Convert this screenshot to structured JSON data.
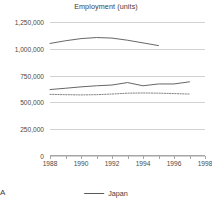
{
  "chart_data": {
    "type": "line",
    "title": "Employment (units)",
    "xlabel": "",
    "ylabel": "",
    "xlim": [
      1988,
      1998
    ],
    "ylim": [
      0,
      1250000
    ],
    "ytick_labels": [
      "0",
      "250,000",
      "500,000",
      "750,000",
      "1,000,000",
      "1,250,000"
    ],
    "ytick_values": [
      0,
      250000,
      500000,
      750000,
      1000000,
      1250000
    ],
    "xtick_labels": [
      "1988",
      "1990",
      "1992",
      "1994",
      "1996",
      "1998"
    ],
    "xtick_values": [
      1988,
      1990,
      1992,
      1994,
      1996,
      1998
    ],
    "minor_xticks": [
      1988,
      1989,
      1990,
      1991,
      1992,
      1993,
      1994,
      1995,
      1996,
      1997,
      1998
    ],
    "grid": "horizontal",
    "legend_position": "bottom",
    "series": [
      {
        "name": "series-upper",
        "style": "solid",
        "color": "#555555",
        "x": [
          1988,
          1989,
          1990,
          1991,
          1992,
          1993,
          1994,
          1995
        ],
        "values": [
          1050000,
          1075000,
          1095000,
          1105000,
          1100000,
          1080000,
          1055000,
          1030000
        ]
      },
      {
        "name": "Japan",
        "style": "solid",
        "color": "#555555",
        "x": [
          1988,
          1989,
          1990,
          1991,
          1992,
          1993,
          1994,
          1995,
          1996,
          1997
        ],
        "values": [
          620000,
          632000,
          645000,
          655000,
          662000,
          685000,
          655000,
          672000,
          672000,
          692000
        ]
      },
      {
        "name": "series-dotted",
        "style": "dotted",
        "color": "#777777",
        "x": [
          1988,
          1989,
          1990,
          1991,
          1992,
          1993,
          1994,
          1995,
          1996,
          1997
        ],
        "values": [
          575000,
          572000,
          570000,
          572000,
          578000,
          586000,
          588000,
          586000,
          582000,
          578000
        ]
      }
    ]
  },
  "legend": {
    "entries": [
      {
        "label": "Japan",
        "style": "solid",
        "color": "#5a5a5a"
      }
    ]
  },
  "figure": {
    "corner_label": "A"
  }
}
